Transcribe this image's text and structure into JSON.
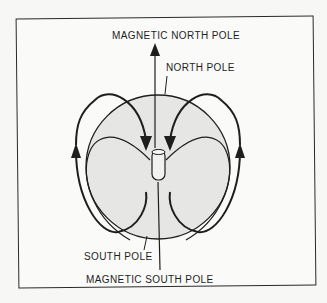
{
  "figure": {
    "labels": {
      "magnetic_north_pole": "MAGNETIC NORTH POLE",
      "north_pole": "NORTH POLE",
      "south_pole": "SOUTH POLE",
      "magnetic_south_pole": "MAGNETIC SOUTH POLE"
    },
    "elements": {
      "earth_sphere": "sphere",
      "bar_magnet": "cylinder",
      "field_lines": 4,
      "magnetic_axis": "vertical arrow"
    },
    "colors": {
      "ink": "#1e1e1e",
      "sphere_fill": "#e6e6e4",
      "background": "#f7f7f5"
    }
  }
}
